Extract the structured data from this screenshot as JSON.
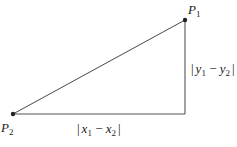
{
  "diagram": {
    "type": "right-triangle-distance",
    "points": {
      "P1": {
        "label": "P",
        "subscript": "1",
        "x": 185,
        "y": 20
      },
      "P2": {
        "label": "P",
        "subscript": "2",
        "x": 13,
        "y": 114
      },
      "corner": {
        "x": 185,
        "y": 114
      }
    },
    "labels": {
      "horizontal": {
        "bar_open": "|",
        "var1": "x",
        "sub1": "1",
        "minus": " − ",
        "var2": "x",
        "sub2": "2",
        "bar_close": "|"
      },
      "vertical": {
        "bar_open": "|",
        "var1": "y",
        "sub1": "1",
        "minus": " − ",
        "var2": "y",
        "sub2": "2",
        "bar_close": "|"
      }
    },
    "colors": {
      "line": "#333333",
      "leg": "#555555",
      "point": "#222222",
      "text": "#222222"
    }
  }
}
